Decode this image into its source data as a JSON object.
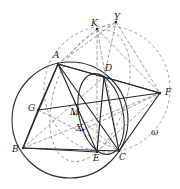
{
  "figure": {
    "type": "geometry-diagram",
    "width": 180,
    "height": 189,
    "background": "#ffffff",
    "stroke_solid": "#2b2b2b",
    "stroke_dashed": "#8a8a8a",
    "label_color": "#1a1a1a"
  },
  "points": [
    {
      "id": "A",
      "label": "A",
      "x": 58,
      "y": 64,
      "label_x": 53,
      "label_y": 51
    },
    {
      "id": "B",
      "label": "B",
      "x": 23,
      "y": 148,
      "label_x": 12,
      "label_y": 145
    },
    {
      "id": "C",
      "label": "C",
      "x": 119,
      "y": 151,
      "label_x": 119,
      "label_y": 153
    },
    {
      "id": "D",
      "label": "D",
      "x": 104,
      "y": 77,
      "label_x": 105,
      "label_y": 64
    },
    {
      "id": "E",
      "label": "E",
      "x": 97,
      "y": 152,
      "label_x": 93,
      "label_y": 154
    },
    {
      "id": "F",
      "label": "F",
      "x": 160,
      "y": 93,
      "label_x": 165,
      "label_y": 88
    },
    {
      "id": "G",
      "label": "G",
      "x": 38,
      "y": 110,
      "label_x": 28,
      "label_y": 104
    },
    {
      "id": "K",
      "label": "K",
      "x": 97,
      "y": 29,
      "label_x": 91,
      "label_y": 19
    },
    {
      "id": "M",
      "label": "M",
      "x": 74,
      "y": 114,
      "label_x": 70,
      "label_y": 108
    },
    {
      "id": "X",
      "label": "X",
      "x": 83,
      "y": 130,
      "label_x": 76,
      "label_y": 124
    },
    {
      "id": "Y",
      "label": "Y",
      "x": 116,
      "y": 22,
      "label_x": 114,
      "label_y": 13
    }
  ],
  "curve_labels": [
    {
      "id": "omega",
      "label": "ω",
      "label_x": 151,
      "label_y": 128
    }
  ],
  "circles": [
    {
      "id": "circumcircle-abc",
      "style": "solid",
      "cx": 70,
      "cy": 120,
      "r": 58,
      "note": "circumcircle of triangle ABC"
    },
    {
      "id": "circle-omega",
      "style": "dashed",
      "cx": 107,
      "cy": 89,
      "r": 63,
      "note": "circle omega through K, F and C"
    }
  ],
  "ellipses": [
    {
      "id": "arc-through-A-D-E",
      "style": "solid",
      "cx": 101,
      "cy": 114,
      "rx": 22,
      "ry": 41,
      "rotation": -12,
      "note": "lens arc through D, E and C"
    },
    {
      "id": "arc-dashed-A-K",
      "style": "dashed",
      "cx": 90,
      "cy": 96,
      "rx": 36,
      "ry": 68,
      "rotation": 18,
      "note": "dashed oval through A and K"
    }
  ],
  "solid_segments": [
    {
      "from": "A",
      "to": "B"
    },
    {
      "from": "A",
      "to": "C"
    },
    {
      "from": "A",
      "to": "E"
    },
    {
      "from": "A",
      "to": "D"
    },
    {
      "from": "A",
      "to": "F"
    },
    {
      "from": "B",
      "to": "C"
    },
    {
      "from": "B",
      "to": "E"
    },
    {
      "from": "D",
      "to": "F"
    },
    {
      "from": "C",
      "to": "F"
    },
    {
      "from": "G",
      "to": "F"
    },
    {
      "from": "G",
      "to": "B"
    },
    {
      "from": "G",
      "to": "A"
    },
    {
      "from": "D",
      "to": "E"
    },
    {
      "from": "D",
      "to": "C"
    }
  ],
  "dashed_segments": [
    {
      "from": "K",
      "to": "A"
    },
    {
      "from": "K",
      "to": "E"
    },
    {
      "from": "K",
      "to": "C"
    },
    {
      "from": "K",
      "to": "F"
    },
    {
      "from": "K",
      "to": "Y"
    },
    {
      "from": "Y",
      "to": "F"
    },
    {
      "from": "Y",
      "to": "D"
    },
    {
      "from": "B",
      "to": "F"
    },
    {
      "from": "B",
      "to": "D"
    },
    {
      "from": "A",
      "to": "Y"
    },
    {
      "from": "E",
      "to": "F"
    },
    {
      "from": "X",
      "to": "F"
    },
    {
      "from": "G",
      "to": "C"
    },
    {
      "from": "M",
      "to": "C"
    }
  ]
}
